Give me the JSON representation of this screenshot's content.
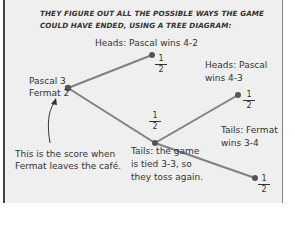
{
  "title": "THEY FIGURE OUT ALL THE POSSIBLE WAYS THE GAME COULD HAVE ENDED, USING A TREE DIAGRAM:",
  "root": {
    "line1": "Pascal 3",
    "line2": "Fermat 2",
    "annotation_line1": "This is the score when",
    "annotation_line2": "Fermat leaves the café."
  },
  "branches": {
    "heads_top": {
      "label": "Heads: Pascal wins 4-2",
      "probability": {
        "num": "1",
        "den": "2"
      }
    },
    "tails_middle": {
      "line1": "Tails: the game",
      "line2": "is tied 3-3, so",
      "line3": "they toss again.",
      "probability": {
        "num": "1",
        "den": "2"
      }
    },
    "heads_second": {
      "line1": "Heads: Pascal",
      "line2": "wins 4-3",
      "probability": {
        "num": "1",
        "den": "2"
      }
    },
    "tails_second": {
      "line1": "Tails: Fermat",
      "line2": "wins 3-4",
      "probability": {
        "num": "1",
        "den": "2"
      }
    }
  },
  "colors": {
    "background": "#efefef",
    "line": "#7a7a7a",
    "node": "#555555",
    "text": "#333333"
  }
}
